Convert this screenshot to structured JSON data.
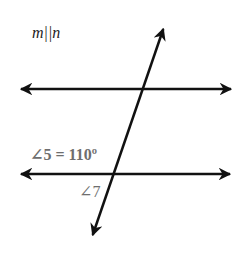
{
  "diagram": {
    "title": "m||n",
    "labels": {
      "angle5": "∠5 = 110º",
      "angle7": "∠7"
    },
    "lines": {
      "m": {
        "x1": 19,
        "y1": 89,
        "x2": 233,
        "y2": 89
      },
      "n": {
        "x1": 19,
        "y1": 174,
        "x2": 232,
        "y2": 174
      },
      "transversal": {
        "x1": 164,
        "y1": 27,
        "x2": 92,
        "y2": 237
      }
    },
    "colors": {
      "line": "#111111",
      "label": "#6e6e6e",
      "title": "#222222"
    }
  }
}
